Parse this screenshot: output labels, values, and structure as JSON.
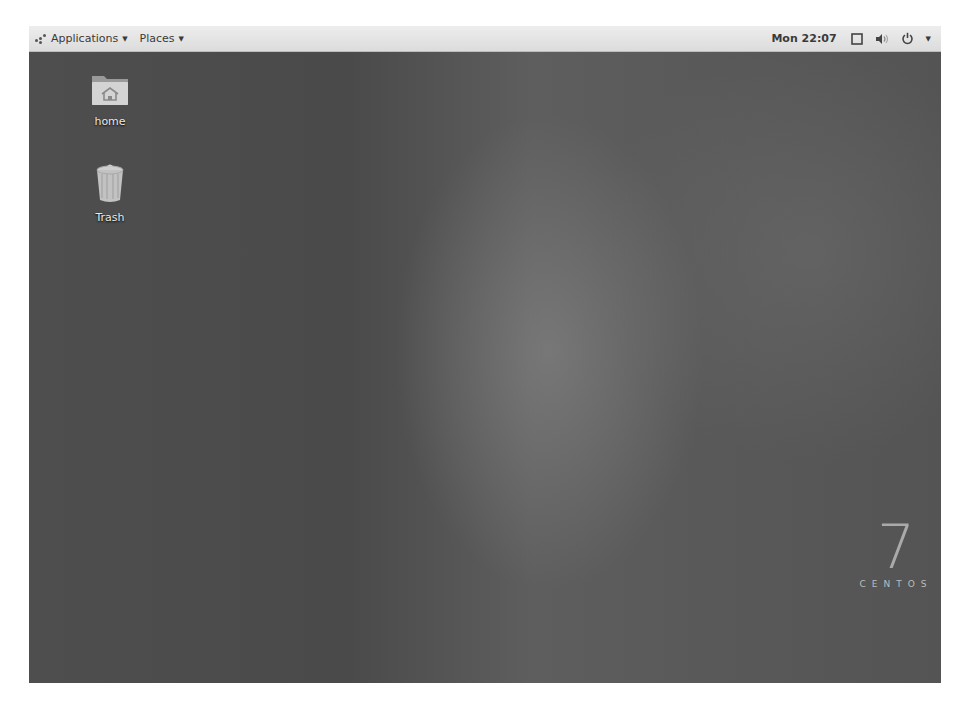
{
  "topbar": {
    "applications_label": "Applications",
    "places_label": "Places",
    "clock": "Mon 22:07",
    "tray_icons": [
      "window-switcher-icon",
      "volume-icon",
      "power-icon",
      "chevron-down-icon"
    ]
  },
  "desktop": {
    "icons": [
      {
        "label": "home",
        "icon": "home-folder-icon"
      },
      {
        "label": "Trash",
        "icon": "trash-icon"
      }
    ],
    "branding": {
      "version": "7",
      "name": "CENTOS"
    }
  },
  "colors": {
    "panel_bg": "#e4e4e4",
    "desktop_bg": "#555555",
    "text_dark": "#3a3a3a",
    "icon_label": "#e8e8e8"
  }
}
